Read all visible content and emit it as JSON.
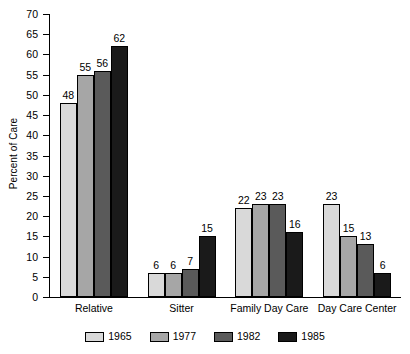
{
  "chart_data": {
    "type": "bar",
    "title": "",
    "xlabel": "",
    "ylabel": "Percent of Care",
    "ylim": [
      0,
      70
    ],
    "ytick_step": 5,
    "yticks": [
      70,
      65,
      60,
      55,
      50,
      45,
      40,
      35,
      30,
      25,
      20,
      15,
      10,
      5,
      0
    ],
    "grid": false,
    "legend_position": "bottom",
    "categories": [
      "Relative",
      "Sitter",
      "Family Day Care",
      "Day Care Center"
    ],
    "series": [
      {
        "name": "1965",
        "color": "#d9d9d9",
        "values": [
          48,
          6,
          22,
          23
        ]
      },
      {
        "name": "1977",
        "color": "#a6a6a6",
        "values": [
          55,
          6,
          23,
          15
        ]
      },
      {
        "name": "1982",
        "color": "#5a5a5a",
        "values": [
          56,
          7,
          23,
          13
        ]
      },
      {
        "name": "1985",
        "color": "#1a1a1a",
        "values": [
          62,
          15,
          16,
          6
        ]
      }
    ]
  }
}
